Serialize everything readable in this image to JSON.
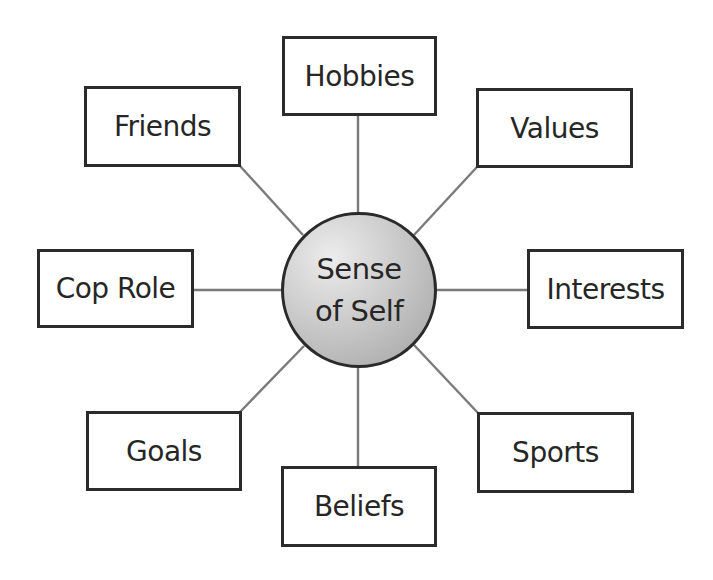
{
  "diagram": {
    "type": "hub-and-spoke concept map",
    "colors": {
      "connector": "#7a7a7a",
      "box_border": "#2b2b2b",
      "text": "#262626",
      "center_fill_light": "#ececec",
      "center_fill_dark": "#a2a2a2"
    },
    "center": {
      "line1": "Sense",
      "line2": "of Self",
      "cx": 359,
      "cy": 290,
      "r": 78
    },
    "nodes": [
      {
        "label": "Hobbies",
        "x": 282,
        "y": 36,
        "w": 155,
        "h": 80
      },
      {
        "label": "Values",
        "x": 476,
        "y": 88,
        "w": 157,
        "h": 80
      },
      {
        "label": "Interests",
        "x": 527,
        "y": 249,
        "w": 157,
        "h": 80
      },
      {
        "label": "Sports",
        "x": 477,
        "y": 412,
        "w": 157,
        "h": 81
      },
      {
        "label": "Beliefs",
        "x": 281,
        "y": 466,
        "w": 156,
        "h": 81
      },
      {
        "label": "Goals",
        "x": 86,
        "y": 411,
        "w": 156,
        "h": 80
      },
      {
        "label": "Cop Role",
        "x": 37,
        "y": 249,
        "w": 157,
        "h": 79
      },
      {
        "label": "Friends",
        "x": 84,
        "y": 86,
        "w": 157,
        "h": 81
      }
    ],
    "connectors": [
      {
        "to": "Hobbies",
        "x1": 358,
        "y1": 213,
        "x2": 358,
        "y2": 115
      },
      {
        "to": "Values",
        "x1": 414,
        "y1": 235,
        "x2": 477,
        "y2": 167
      },
      {
        "to": "Interests",
        "x1": 437,
        "y1": 290,
        "x2": 528,
        "y2": 290
      },
      {
        "to": "Sports",
        "x1": 414,
        "y1": 345,
        "x2": 478,
        "y2": 413
      },
      {
        "to": "Beliefs",
        "x1": 358,
        "y1": 368,
        "x2": 358,
        "y2": 467
      },
      {
        "to": "Goals",
        "x1": 304,
        "y1": 346,
        "x2": 240,
        "y2": 412
      },
      {
        "to": "Cop Role",
        "x1": 281,
        "y1": 290,
        "x2": 193,
        "y2": 290
      },
      {
        "to": "Friends",
        "x1": 303,
        "y1": 235,
        "x2": 240,
        "y2": 166
      }
    ]
  }
}
